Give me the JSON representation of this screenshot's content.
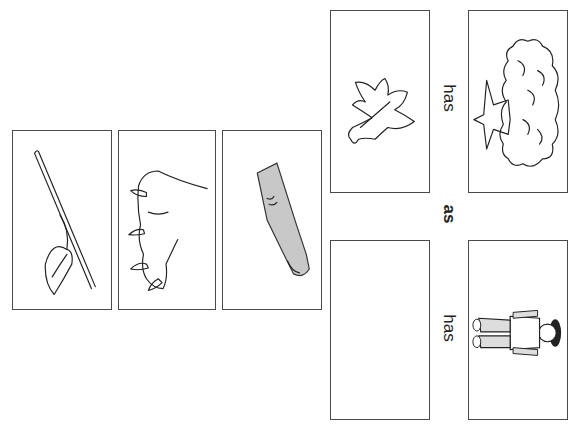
{
  "worksheet": {
    "type": "analogy",
    "connector_word": "as",
    "relation_word_top": "has",
    "relation_word_bottom": "has",
    "analogy_cards": [
      {
        "id": "tree",
        "picture": "tree-icon",
        "description": "tree"
      },
      {
        "id": "leaf",
        "picture": "leaf-icon",
        "description": "leaf"
      },
      {
        "id": "child",
        "picture": "child-icon",
        "description": "child"
      },
      {
        "id": "answer",
        "picture": "",
        "description": "empty answer box"
      }
    ],
    "answer_choices": [
      {
        "id": "stem-leaf",
        "picture": "stem-leaf-icon",
        "description": "leaf on stem"
      },
      {
        "id": "claws",
        "picture": "claws-icon",
        "description": "animal paw with claws"
      },
      {
        "id": "finger",
        "picture": "finger-icon",
        "description": "finger with nail"
      }
    ],
    "colors": {
      "border": "#4a4a4a",
      "line": "#222222",
      "finger_fill": "#c8c8c8"
    }
  }
}
